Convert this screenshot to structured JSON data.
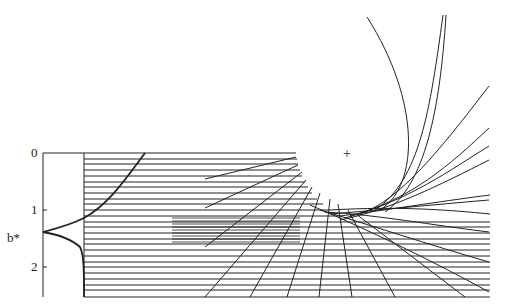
{
  "figure": {
    "type": "ray-diagram",
    "axis": {
      "label": "b*",
      "ticks": [
        {
          "label": "0",
          "value": 0
        },
        {
          "label": "1",
          "value": 1
        },
        {
          "label": "2",
          "value": 2
        }
      ],
      "range": [
        0,
        2.5
      ]
    },
    "marker": "+",
    "colors": {
      "line": "#222222",
      "background": "#ffffff"
    }
  }
}
